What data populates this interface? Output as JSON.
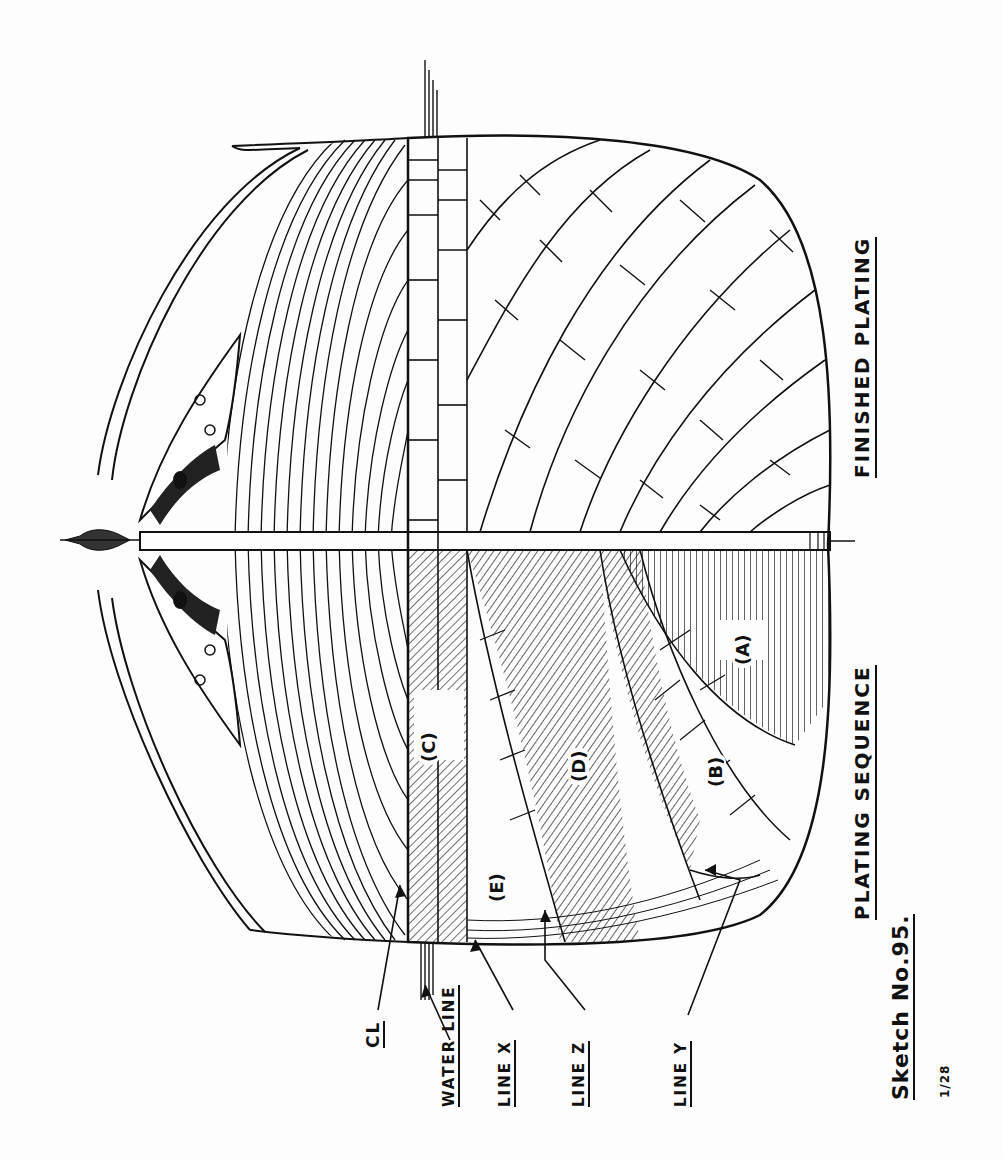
{
  "drawing": {
    "title_finished": "FINISHED PLATING",
    "title_sequence": "PLATING SEQUENCE",
    "sketch_number": "Sketch No.95.",
    "scale": "1/28",
    "orientation": "rotated 90° counter-clockwise",
    "colors": {
      "ink": "#111111",
      "paper": "#fdfdfd"
    }
  },
  "labels": {
    "cl": "CL",
    "water_line": "WATER LINE",
    "line_x": "LINE X",
    "line_z": "LINE Z",
    "line_y": "LINE Y"
  },
  "plate_sections": [
    {
      "id": "A",
      "label": "(A)"
    },
    {
      "id": "B",
      "label": "(B)"
    },
    {
      "id": "C",
      "label": "(C)"
    },
    {
      "id": "D",
      "label": "(D)"
    },
    {
      "id": "E",
      "label": "(E)"
    }
  ],
  "halves": [
    {
      "name": "finished-plating",
      "side": "upper"
    },
    {
      "name": "plating-sequence",
      "side": "lower"
    }
  ]
}
